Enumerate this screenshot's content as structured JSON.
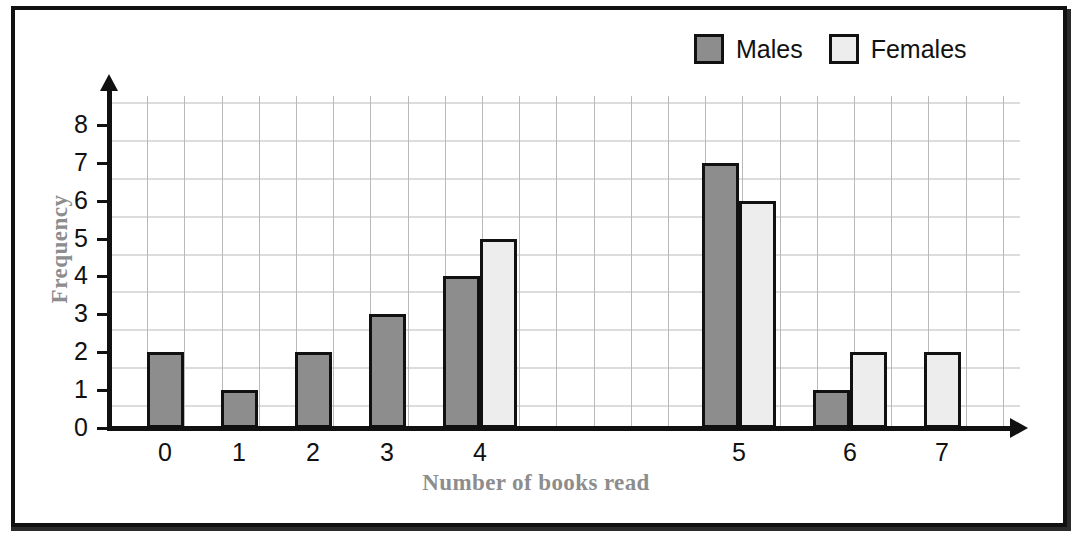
{
  "chart_data": {
    "type": "bar",
    "title": "",
    "subtitle": "",
    "xlabel": "Number of books read",
    "ylabel": "Frequency",
    "categories": [
      "0",
      "1",
      "2",
      "3",
      "4",
      "5",
      "6",
      "7"
    ],
    "series": [
      {
        "name": "Males",
        "color": "#8d8d8d",
        "values": [
          2,
          1,
          2,
          3,
          4,
          7,
          1,
          0
        ]
      },
      {
        "name": "Females",
        "color": "#ededed",
        "values": [
          0,
          0,
          0,
          0,
          5,
          6,
          2,
          2
        ]
      }
    ],
    "ylim": [
      0,
      8
    ],
    "yticks": [
      "0",
      "1",
      "2",
      "3",
      "4",
      "5",
      "6",
      "7",
      "8"
    ],
    "xticks": [
      "0",
      "1",
      "2",
      "3",
      "4",
      "5",
      "6",
      "7"
    ],
    "grid": true,
    "legend_position": "top-right",
    "bar_outline_color": "#111111",
    "axis_color": "#111111",
    "grid_color": "#b9b9b9",
    "axis_title_color": "#8d8d8d"
  },
  "legend": {
    "entries": [
      {
        "label": "Males",
        "swatch": "males-swatch"
      },
      {
        "label": "Females",
        "swatch": "females-swatch"
      }
    ]
  },
  "axes": {
    "y": {
      "title": "Frequency",
      "ticks": [
        "8",
        "7",
        "6",
        "5",
        "4",
        "3",
        "2",
        "1",
        "0"
      ]
    },
    "x": {
      "title": "Number of books read",
      "ticks": [
        "0",
        "1",
        "2",
        "3",
        "4",
        "5",
        "6",
        "7"
      ]
    }
  }
}
